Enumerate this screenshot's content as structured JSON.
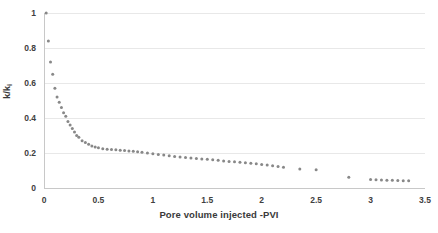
{
  "chart_data": {
    "type": "scatter",
    "title": "",
    "xlabel": "Pore volume injected -PVI",
    "ylabel": "k/k₁",
    "ylabel_main": "k/k",
    "ylabel_sub": "i",
    "xlim": [
      0,
      3.5
    ],
    "ylim": [
      0,
      1
    ],
    "xticks": [
      0,
      0.5,
      1,
      1.5,
      2,
      2.5,
      3,
      3.5
    ],
    "xtick_labels": [
      "0",
      "0.5",
      "1",
      "1.5",
      "2",
      "2.5",
      "3",
      "3.5"
    ],
    "yticks": [
      0,
      0.2,
      0.4,
      0.6,
      0.8,
      1
    ],
    "ytick_labels": [
      "0",
      "0.2",
      "0.4",
      "0.6",
      "0.8",
      "1"
    ],
    "grid": "horizontal",
    "grid_color": "#e8e8e8",
    "axis_color": "#c8c8c8",
    "marker_color": "#888888",
    "marker_size": 3.0,
    "legend": "none",
    "series": [
      {
        "name": "k/ki vs PVI",
        "x": [
          0.02,
          0.04,
          0.06,
          0.08,
          0.1,
          0.12,
          0.14,
          0.16,
          0.18,
          0.2,
          0.22,
          0.24,
          0.26,
          0.28,
          0.3,
          0.32,
          0.35,
          0.38,
          0.41,
          0.44,
          0.47,
          0.5,
          0.54,
          0.58,
          0.62,
          0.66,
          0.7,
          0.74,
          0.78,
          0.82,
          0.86,
          0.9,
          0.95,
          1.0,
          1.05,
          1.1,
          1.15,
          1.2,
          1.25,
          1.3,
          1.35,
          1.4,
          1.45,
          1.5,
          1.55,
          1.6,
          1.65,
          1.7,
          1.75,
          1.8,
          1.85,
          1.9,
          1.95,
          2.0,
          2.05,
          2.1,
          2.15,
          2.2,
          2.35,
          2.5,
          2.8,
          3.0,
          3.05,
          3.1,
          3.15,
          3.2,
          3.25,
          3.3,
          3.35
        ],
        "y": [
          1.0,
          0.84,
          0.72,
          0.65,
          0.57,
          0.52,
          0.49,
          0.46,
          0.43,
          0.41,
          0.38,
          0.36,
          0.34,
          0.32,
          0.3,
          0.29,
          0.27,
          0.26,
          0.25,
          0.24,
          0.235,
          0.23,
          0.225,
          0.222,
          0.22,
          0.218,
          0.216,
          0.214,
          0.212,
          0.21,
          0.207,
          0.204,
          0.2,
          0.196,
          0.192,
          0.188,
          0.184,
          0.18,
          0.177,
          0.174,
          0.171,
          0.168,
          0.166,
          0.164,
          0.161,
          0.158,
          0.155,
          0.152,
          0.15,
          0.147,
          0.144,
          0.141,
          0.138,
          0.135,
          0.131,
          0.127,
          0.123,
          0.118,
          0.108,
          0.104,
          0.062,
          0.049,
          0.047,
          0.046,
          0.045,
          0.044,
          0.043,
          0.042,
          0.041
        ]
      }
    ]
  }
}
